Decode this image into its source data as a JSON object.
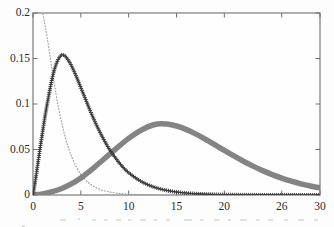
{
  "chart_data": {
    "type": "line",
    "title": "",
    "subtitle": "",
    "xlabel": "",
    "ylabel": "",
    "xlim": [
      0,
      30
    ],
    "ylim": [
      0,
      0.2
    ],
    "grid": false,
    "legend_position": "none",
    "x_ticks": [
      0,
      5,
      10,
      15,
      20,
      26,
      30
    ],
    "x_tick_labels": [
      "0",
      "5",
      "10",
      "15",
      "20",
      "26",
      "30"
    ],
    "y_ticks": [
      0,
      0.05,
      0.1,
      0.15,
      0.2
    ],
    "y_tick_labels": [
      "0",
      "0.05",
      "0.1",
      "0.15",
      "0.2"
    ],
    "background_color": "#fdfdfd",
    "axis_color": "#6e6e6e",
    "series": [
      {
        "name": "plus-marker-curve",
        "style": "plus-markers",
        "color": "#3a3a3a",
        "line_width": 1.4,
        "marker": "+",
        "peak_x": 3.0,
        "peak_y": 0.154,
        "x": [
          0.0,
          0.25,
          0.5,
          0.75,
          1.0,
          1.25,
          1.5,
          1.75,
          2.0,
          2.25,
          2.5,
          2.75,
          3.0,
          3.25,
          3.5,
          3.75,
          4.0,
          4.5,
          5.0,
          5.5,
          6.0,
          6.5,
          7.0,
          7.5,
          8.0,
          8.5,
          9.0,
          9.5,
          10.0,
          11.0,
          12.0,
          13.0,
          14.0,
          15.0,
          16.0,
          17.0,
          18.0,
          19.0,
          20.0,
          22.0,
          24.0,
          26.0,
          28.0,
          30.0
        ],
        "y": [
          0.0,
          0.016,
          0.034,
          0.052,
          0.069,
          0.086,
          0.101,
          0.115,
          0.128,
          0.138,
          0.146,
          0.151,
          0.154,
          0.1535,
          0.151,
          0.147,
          0.1425,
          0.131,
          0.118,
          0.105,
          0.092,
          0.08,
          0.069,
          0.059,
          0.05,
          0.0425,
          0.0355,
          0.0295,
          0.0245,
          0.0168,
          0.0113,
          0.0075,
          0.005,
          0.0033,
          0.0021,
          0.0014,
          0.0009,
          0.0006,
          0.0004,
          0.00016,
          7e-05,
          3e-05,
          1e-05,
          5e-06
        ]
      },
      {
        "name": "thick-gray-curve",
        "style": "solid-thick",
        "color": "#848484",
        "line_width": 5.5,
        "peak_x": 13.0,
        "peak_y": 0.078,
        "x": [
          0.0,
          1.0,
          2.0,
          3.0,
          4.0,
          5.0,
          6.0,
          7.0,
          8.0,
          9.0,
          10.0,
          11.0,
          12.0,
          13.0,
          14.0,
          15.0,
          16.0,
          17.0,
          18.0,
          19.0,
          20.0,
          21.0,
          22.0,
          23.0,
          24.0,
          25.0,
          26.0,
          27.0,
          28.0,
          29.0,
          30.0
        ],
        "y": [
          0.0,
          0.0012,
          0.0036,
          0.0072,
          0.0122,
          0.0188,
          0.0268,
          0.0357,
          0.0448,
          0.0538,
          0.0622,
          0.0694,
          0.0749,
          0.078,
          0.0779,
          0.0758,
          0.0721,
          0.0672,
          0.0615,
          0.0553,
          0.049,
          0.0429,
          0.0371,
          0.0317,
          0.0268,
          0.0224,
          0.0186,
          0.0152,
          0.0123,
          0.0099,
          0.0079
        ]
      },
      {
        "name": "dotted-decay-curve",
        "style": "dotted",
        "color": "#9a9a9a",
        "line_width": 1.1,
        "x": [
          0.7,
          0.9,
          1.1,
          1.3,
          1.5,
          1.7,
          1.9,
          2.1,
          2.3,
          2.5,
          2.75,
          3.0,
          3.25,
          3.5,
          3.75,
          4.0,
          4.5,
          5.0,
          5.5,
          6.0,
          6.5,
          7.0,
          7.5,
          8.0,
          8.5,
          9.0,
          9.5,
          10.0,
          11.0,
          12.0,
          13.0
        ],
        "y": [
          0.215,
          0.206,
          0.196,
          0.184,
          0.172,
          0.158,
          0.1445,
          0.131,
          0.118,
          0.105,
          0.0915,
          0.0795,
          0.0685,
          0.059,
          0.0505,
          0.0432,
          0.0315,
          0.0228,
          0.0165,
          0.0119,
          0.0086,
          0.0062,
          0.0045,
          0.0033,
          0.0024,
          0.0018,
          0.0013,
          0.001,
          0.0005,
          0.00027,
          0.00015
        ]
      }
    ]
  },
  "figure": {
    "artifact_note": ""
  }
}
